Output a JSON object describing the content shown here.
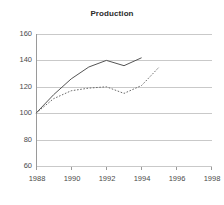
{
  "chart_data": {
    "type": "line",
    "title": "Production",
    "xlabel": "",
    "ylabel": "",
    "xlim": [
      1988,
      1998
    ],
    "ylim": [
      60,
      160
    ],
    "xticks": [
      1988,
      1990,
      1992,
      1994,
      1996,
      1998
    ],
    "yticks": [
      60,
      80,
      100,
      120,
      140,
      160
    ],
    "grid": true,
    "legend": "none",
    "x": [
      1988,
      1989,
      1990,
      1991,
      1992,
      1993,
      1994,
      1995
    ],
    "series": [
      {
        "name": "solid-series",
        "style": "solid",
        "color": "#555555",
        "x": [
          1988,
          1989,
          1990,
          1991,
          1992,
          1993,
          1994
        ],
        "values": [
          100,
          114,
          126,
          135,
          140,
          136,
          142
        ]
      },
      {
        "name": "dotted-series",
        "style": "dotted",
        "color": "#6a6a6a",
        "x": [
          1988,
          1989,
          1990,
          1991,
          1992,
          1993,
          1994,
          1995
        ],
        "values": [
          100,
          111,
          117,
          119,
          120,
          115,
          121,
          135
        ]
      }
    ]
  },
  "chart": {
    "title": "Production",
    "y_tick_labels": [
      "160",
      "140",
      "120",
      "100",
      "80",
      "60"
    ],
    "x_tick_labels": [
      "1988",
      "1990",
      "1992",
      "1994",
      "1996",
      "1998"
    ]
  }
}
